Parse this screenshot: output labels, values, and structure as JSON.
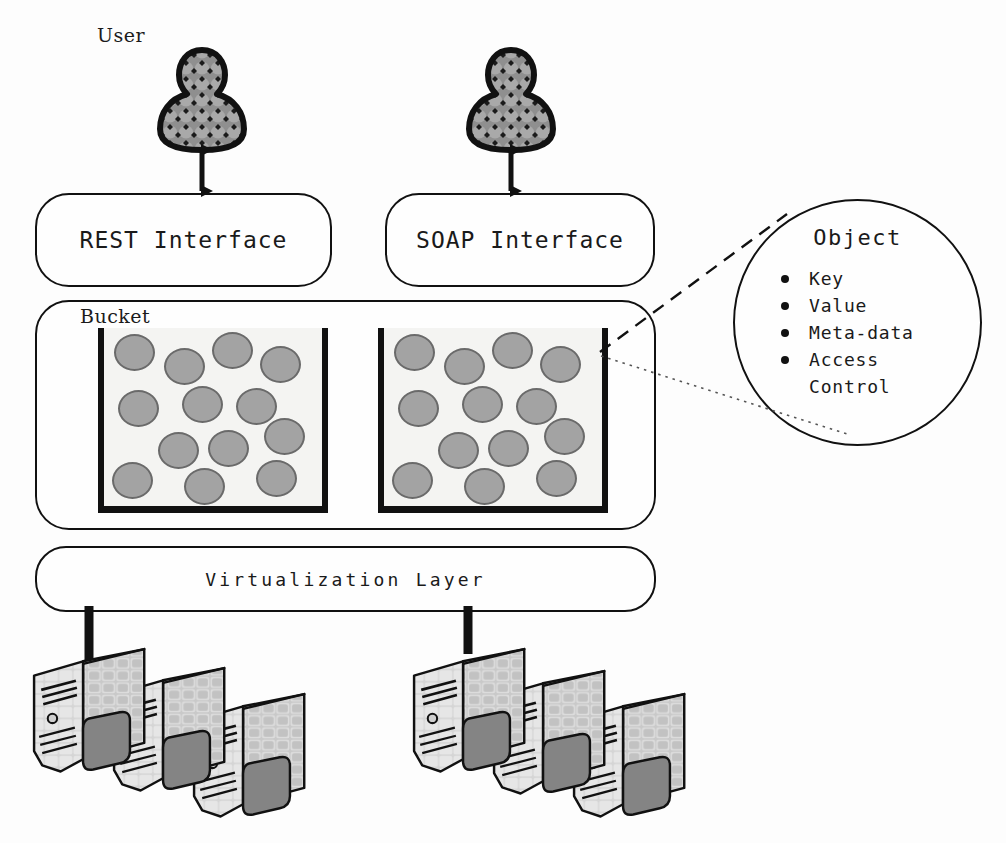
{
  "diagram": {
    "labels": {
      "user": "User",
      "bucket": "Bucket"
    },
    "interfaces": [
      {
        "id": "rest",
        "label": "REST Interface"
      },
      {
        "id": "soap",
        "label": "SOAP Interface"
      }
    ],
    "virtualization": {
      "label": "Virtualization Layer"
    },
    "object_detail": {
      "title": "Object",
      "attributes": [
        "Key",
        "Value",
        "Meta-data",
        "Access\nControl"
      ]
    },
    "buckets": [
      {
        "id": "bucket-left",
        "object_count": 13,
        "objects": [
          {
            "x": 10,
            "y": 6
          },
          {
            "x": 60,
            "y": 20
          },
          {
            "x": 108,
            "y": 4
          },
          {
            "x": 156,
            "y": 18
          },
          {
            "x": 14,
            "y": 62
          },
          {
            "x": 78,
            "y": 58
          },
          {
            "x": 132,
            "y": 60
          },
          {
            "x": 54,
            "y": 104
          },
          {
            "x": 104,
            "y": 102
          },
          {
            "x": 160,
            "y": 90
          },
          {
            "x": 8,
            "y": 134
          },
          {
            "x": 80,
            "y": 140
          },
          {
            "x": 152,
            "y": 132
          }
        ]
      },
      {
        "id": "bucket-right",
        "object_count": 13,
        "objects": [
          {
            "x": 10,
            "y": 6
          },
          {
            "x": 60,
            "y": 20
          },
          {
            "x": 108,
            "y": 4
          },
          {
            "x": 156,
            "y": 18
          },
          {
            "x": 14,
            "y": 62
          },
          {
            "x": 78,
            "y": 58
          },
          {
            "x": 132,
            "y": 60
          },
          {
            "x": 54,
            "y": 104
          },
          {
            "x": 104,
            "y": 102
          },
          {
            "x": 160,
            "y": 90
          },
          {
            "x": 8,
            "y": 134
          },
          {
            "x": 80,
            "y": 140
          },
          {
            "x": 152,
            "y": 132
          }
        ]
      }
    ],
    "server_clusters": [
      {
        "id": "server-cluster-left",
        "server_count": 3
      },
      {
        "id": "server-cluster-right",
        "server_count": 3
      }
    ],
    "connectors": [
      {
        "id": "user-rest-arrow",
        "type": "double-arrow"
      },
      {
        "id": "user-soap-arrow",
        "type": "double-arrow"
      },
      {
        "id": "object-callout-dashed",
        "type": "dashed-line"
      },
      {
        "id": "object-callout-dotted",
        "type": "dotted-line"
      },
      {
        "id": "virtualization-server-left",
        "type": "thick-line"
      },
      {
        "id": "virtualization-server-right",
        "type": "thick-line"
      }
    ],
    "colors": {
      "stroke": "#111111",
      "object_fill": "#a3a3a3",
      "object_stroke": "#6a6a6a",
      "bucket_fill": "#f4f4f2",
      "server_light": "#dcdcdc",
      "server_mid": "#b9b9b9",
      "server_dark": "#7d7d7d",
      "background": "#fdfdfd"
    }
  }
}
